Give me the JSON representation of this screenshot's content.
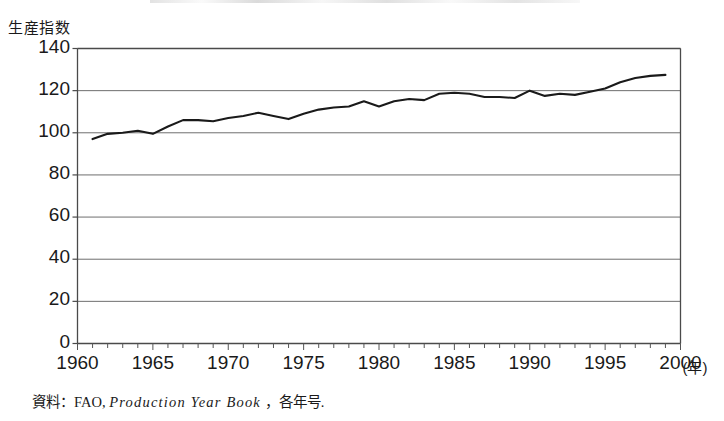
{
  "figure": {
    "y_axis_title": "生産指数",
    "x_unit_label": "(年)",
    "source_note_prefix": "資料：FAO,",
    "source_note_italic": "Production Year Book",
    "source_note_suffix": "，各年号."
  },
  "chart_data": {
    "type": "line",
    "title": "生産指数",
    "xlabel": "(年)",
    "ylabel": "生産指数",
    "xlim": [
      1960,
      2000
    ],
    "ylim": [
      0,
      140
    ],
    "grid": true,
    "legend": "none",
    "line_color": "#1a1a1a",
    "xticks": [
      1960,
      1965,
      1970,
      1975,
      1980,
      1985,
      1990,
      1995,
      2000
    ],
    "xtick_labels": [
      "1960",
      "1965",
      "1970",
      "1975",
      "1980",
      "1985",
      "1990",
      "1995",
      "2000"
    ],
    "minor_xtick_interval": 1,
    "yticks": [
      0,
      20,
      40,
      60,
      80,
      100,
      120,
      140
    ],
    "ytick_labels": [
      "0",
      "20",
      "40",
      "60",
      "80",
      "100",
      "120",
      "140"
    ],
    "x": [
      1961,
      1962,
      1963,
      1964,
      1965,
      1966,
      1967,
      1968,
      1969,
      1970,
      1971,
      1972,
      1973,
      1974,
      1975,
      1976,
      1977,
      1978,
      1979,
      1980,
      1981,
      1982,
      1983,
      1984,
      1985,
      1986,
      1987,
      1988,
      1989,
      1990,
      1991,
      1992,
      1993,
      1994,
      1995,
      1996,
      1997,
      1998,
      1999
    ],
    "values": [
      97,
      99.5,
      100,
      101,
      99.5,
      103,
      106,
      106,
      105.5,
      107,
      108,
      109.5,
      108,
      106.5,
      109,
      111,
      112,
      112.5,
      115,
      112.5,
      115,
      116,
      115.5,
      118.5,
      119,
      118.5,
      117,
      117,
      116.5,
      120,
      117.5,
      118.5,
      118,
      119.5,
      121,
      124,
      126,
      127,
      127.5
    ],
    "series": [
      {
        "name": "生産指数",
        "values": [
          97,
          99.5,
          100,
          101,
          99.5,
          103,
          106,
          106,
          105.5,
          107,
          108,
          109.5,
          108,
          106.5,
          109,
          111,
          112,
          112.5,
          115,
          112.5,
          115,
          116,
          115.5,
          118.5,
          119,
          118.5,
          117,
          117,
          116.5,
          120,
          117.5,
          118.5,
          118,
          119.5,
          121,
          124,
          126,
          127,
          127.5
        ]
      }
    ]
  }
}
